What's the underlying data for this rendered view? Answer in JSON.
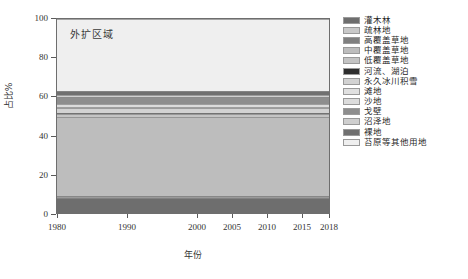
{
  "annotation": "外扩区域",
  "axes": {
    "y_title": "占比%",
    "x_title": "年份",
    "y_ticks": [
      "0",
      "20",
      "40",
      "60",
      "80",
      "100"
    ],
    "x_ticks": [
      "1980",
      "1990",
      "2000",
      "2005",
      "2010",
      "2015",
      "2018"
    ]
  },
  "legend": {
    "items": [
      {
        "label": "灌木林",
        "color": "#6e6e6e"
      },
      {
        "label": "疏林地",
        "color": "#c9c9c9"
      },
      {
        "label": "高覆盖草地",
        "color": "#808080"
      },
      {
        "label": "中覆盖草地",
        "color": "#bdbdbd"
      },
      {
        "label": "低覆盖草地",
        "color": "#c4c4c4"
      },
      {
        "label": "河流、湖泊",
        "color": "#2e2e2e"
      },
      {
        "label": "永久冰川积雪",
        "color": "#d2d2d2"
      },
      {
        "label": "滩地",
        "color": "#e0e0e0"
      },
      {
        "label": "沙地",
        "color": "#dcdcdc"
      },
      {
        "label": "戈壁",
        "color": "#8e8e8e"
      },
      {
        "label": "沼泽地",
        "color": "#cfcfcf"
      },
      {
        "label": "裸地",
        "color": "#707070"
      },
      {
        "label": "苔原等其他用地",
        "color": "#efefef"
      }
    ]
  },
  "chart_data": {
    "type": "area",
    "title": "外扩区域",
    "xlabel": "年份",
    "ylabel": "占比%",
    "xlim": [
      1980,
      2018
    ],
    "ylim": [
      0,
      100
    ],
    "grid": false,
    "legend_position": "right",
    "x": [
      1980,
      1990,
      2000,
      2005,
      2010,
      2015,
      2018
    ],
    "series": [
      {
        "name": "灌木林",
        "color": "#6e6e6e",
        "values": [
          7.6,
          7.6,
          7.5,
          7.5,
          7.4,
          7.4,
          7.4
        ]
      },
      {
        "name": "疏林地",
        "color": "#c9c9c9",
        "values": [
          0.9,
          0.9,
          0.9,
          0.9,
          0.9,
          0.9,
          0.9
        ]
      },
      {
        "name": "高覆盖草地",
        "color": "#808080",
        "values": [
          0.6,
          0.6,
          0.6,
          0.6,
          0.6,
          0.6,
          0.6
        ]
      },
      {
        "name": "中覆盖草地",
        "color": "#bdbdbd",
        "values": [
          40.2,
          40.2,
          40.1,
          40.1,
          40.5,
          40.6,
          40.6
        ]
      },
      {
        "name": "低覆盖草地",
        "color": "#c4c4c4",
        "values": [
          1.6,
          1.6,
          1.6,
          1.6,
          1.7,
          1.7,
          1.7
        ]
      },
      {
        "name": "河流、湖泊",
        "color": "#2e2e2e",
        "values": [
          0.5,
          0.5,
          0.5,
          0.5,
          0.5,
          0.5,
          0.5
        ]
      },
      {
        "name": "永久冰川积雪",
        "color": "#d2d2d2",
        "values": [
          2.5,
          2.5,
          2.5,
          2.5,
          2.6,
          2.6,
          2.6
        ]
      },
      {
        "name": "滩地",
        "color": "#e0e0e0",
        "values": [
          0.7,
          0.7,
          0.7,
          0.7,
          0.7,
          0.7,
          0.7
        ]
      },
      {
        "name": "沙地",
        "color": "#dcdcdc",
        "values": [
          1.4,
          1.4,
          1.4,
          1.4,
          1.4,
          1.4,
          1.4
        ]
      },
      {
        "name": "戈壁",
        "color": "#8e8e8e",
        "values": [
          3.6,
          3.6,
          3.6,
          3.6,
          3.4,
          3.3,
          3.3
        ]
      },
      {
        "name": "沼泽地",
        "color": "#cfcfcf",
        "values": [
          1.2,
          1.2,
          1.2,
          1.2,
          1.2,
          1.2,
          1.2
        ]
      },
      {
        "name": "裸地",
        "color": "#707070",
        "values": [
          2.2,
          2.2,
          2.2,
          2.2,
          2.1,
          2.1,
          2.1
        ]
      },
      {
        "name": "苔原等其他用地",
        "color": "#efefef",
        "values": [
          37.0,
          37.0,
          37.2,
          37.2,
          37.0,
          37.0,
          37.0
        ]
      }
    ]
  }
}
